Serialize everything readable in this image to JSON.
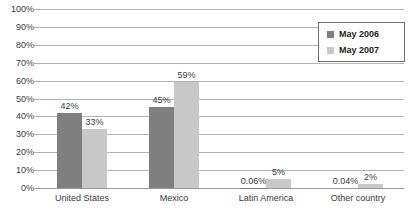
{
  "chart_data": {
    "type": "bar",
    "title": "",
    "subtitle": "",
    "xlabel": "",
    "ylabel": "",
    "ylim": [
      0,
      100
    ],
    "yunit": "%",
    "grid": true,
    "legend_position": "top-right",
    "categories": [
      "United States",
      "Mexico",
      "Latin America",
      "Other country"
    ],
    "ytick_labels": [
      "100%",
      "90%",
      "80%",
      "70%",
      "60%",
      "50%",
      "40%",
      "30%",
      "20%",
      "10%",
      "0%"
    ],
    "ytick_values": [
      100,
      90,
      80,
      70,
      60,
      50,
      40,
      30,
      20,
      10,
      0
    ],
    "series": [
      {
        "name": "May 2006",
        "color": "#7f7f7f",
        "values": [
          42,
          45,
          0.06,
          0.04
        ],
        "labels": [
          "42%",
          "45%",
          "0.06%",
          "0.04%"
        ]
      },
      {
        "name": "May 2007",
        "color": "#c8c8c8",
        "values": [
          33,
          59,
          5,
          2
        ],
        "labels": [
          "33%",
          "59%",
          "5%",
          "2%"
        ]
      }
    ]
  },
  "legend": {
    "items": [
      {
        "label": "May 2006",
        "color": "#7f7f7f"
      },
      {
        "label": "May 2007",
        "color": "#c8c8c8"
      }
    ]
  }
}
